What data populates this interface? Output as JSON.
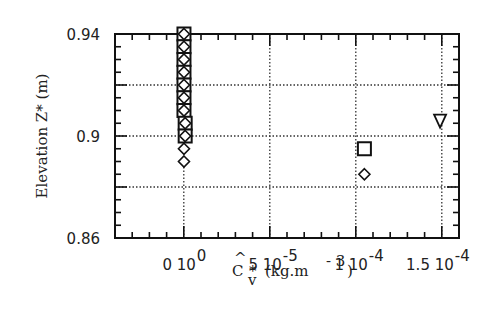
{
  "chart_data": {
    "type": "scatter",
    "title": "",
    "xlabel": "Ĉ_v* (kg.m^-3)",
    "ylabel": "Elevation Z* (m)",
    "xlim": [
      -4e-05,
      0.00016
    ],
    "ylim": [
      0.86,
      0.94
    ],
    "grid": true,
    "x_ticks": [
      0,
      5e-05,
      0.0001,
      0.00015
    ],
    "x_tick_labels": [
      {
        "mant": "0 10",
        "exp": "0"
      },
      {
        "mant": "5 10",
        "exp": "-5"
      },
      {
        "mant": "1 10",
        "exp": "-4"
      },
      {
        "mant": "1.5 10",
        "exp": "-4"
      }
    ],
    "y_ticks": [
      0.86,
      0.9,
      0.94
    ],
    "y_tick_labels": [
      "0.86",
      "0.9",
      "0.94"
    ],
    "y_grid": [
      0.88,
      0.9,
      0.92
    ],
    "x_grid": [
      0,
      5e-05,
      0.0001,
      0.00015
    ],
    "legend": null,
    "series": [
      {
        "name": "squares",
        "marker": "square",
        "points": [
          [
            1e-07,
            0.94
          ],
          [
            1e-07,
            0.935
          ],
          [
            1e-07,
            0.93
          ],
          [
            1e-07,
            0.925
          ],
          [
            1e-07,
            0.92
          ],
          [
            1e-07,
            0.915
          ],
          [
            1e-07,
            0.91
          ],
          [
            8e-07,
            0.905
          ],
          [
            8e-07,
            0.9
          ],
          [
            0.000105,
            0.895
          ]
        ]
      },
      {
        "name": "diamonds",
        "marker": "diamond",
        "points": [
          [
            1e-07,
            0.94
          ],
          [
            1e-07,
            0.935
          ],
          [
            1e-07,
            0.93
          ],
          [
            1e-07,
            0.925
          ],
          [
            1e-07,
            0.92
          ],
          [
            1e-07,
            0.915
          ],
          [
            1e-07,
            0.91
          ],
          [
            8e-07,
            0.905
          ],
          [
            8e-07,
            0.9
          ],
          [
            1e-07,
            0.895
          ],
          [
            1e-07,
            0.89
          ],
          [
            0.000105,
            0.885
          ]
        ]
      },
      {
        "name": "triangle",
        "marker": "triangle-down",
        "points": [
          [
            0.000149,
            0.906
          ]
        ]
      }
    ]
  },
  "labels": {
    "ylabel": "Elevation Z* (m)",
    "xlabel_hat_c": "C",
    "xlabel_hat": "^",
    "xlabel_star": "*",
    "xlabel_sub": "v",
    "xlabel_units": "(kg.m",
    "xlabel_units_exp": "- 3",
    "xlabel_close": ")"
  }
}
